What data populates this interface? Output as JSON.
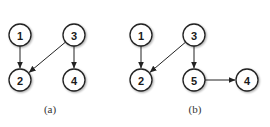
{
  "figure": {
    "subfigures": [
      {
        "id": "a",
        "caption": "(a)",
        "caption_pos": [
          50,
          113
        ],
        "nodes": [
          {
            "id": "1",
            "label": "1",
            "x": 20,
            "y": 35
          },
          {
            "id": "2",
            "label": "2",
            "x": 20,
            "y": 80
          },
          {
            "id": "3",
            "label": "3",
            "x": 74,
            "y": 35
          },
          {
            "id": "4",
            "label": "4",
            "x": 74,
            "y": 80
          }
        ],
        "edges": [
          {
            "from": "1",
            "to": "2"
          },
          {
            "from": "3",
            "to": "2"
          },
          {
            "from": "3",
            "to": "4"
          }
        ]
      },
      {
        "id": "b",
        "caption": "(b)",
        "caption_pos": [
          195,
          113
        ],
        "nodes": [
          {
            "id": "1",
            "label": "1",
            "x": 141,
            "y": 35
          },
          {
            "id": "2",
            "label": "2",
            "x": 141,
            "y": 80
          },
          {
            "id": "3",
            "label": "3",
            "x": 194,
            "y": 35
          },
          {
            "id": "5",
            "label": "5",
            "x": 194,
            "y": 80
          },
          {
            "id": "4",
            "label": "4",
            "x": 247,
            "y": 80
          }
        ],
        "edges": [
          {
            "from": "1",
            "to": "2"
          },
          {
            "from": "3",
            "to": "2"
          },
          {
            "from": "3",
            "to": "5"
          },
          {
            "from": "5",
            "to": "4"
          }
        ]
      }
    ],
    "style": {
      "node_radius": 11,
      "node_fill": "#ffffff",
      "node_stroke": "#222222",
      "edge_color": "#222222",
      "arrowhead": "filled-triangle"
    }
  }
}
